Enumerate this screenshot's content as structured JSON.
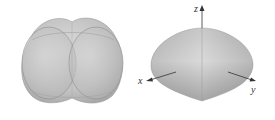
{
  "figures": [
    {
      "id": "left",
      "description": "Union of overlapping spheres (lobed solid), no axes shown"
    },
    {
      "id": "right",
      "description": "Spindle / lens-shaped solid of revolution with coordinate axes",
      "axes": {
        "x_label": "x",
        "y_label": "y",
        "z_label": "z"
      }
    }
  ],
  "colors": {
    "surface_light": "#d9d9d9",
    "surface_mid": "#bdbdbd",
    "surface_dark": "#9e9e9e",
    "edge": "#8a8a8a",
    "axis": "#333333"
  }
}
